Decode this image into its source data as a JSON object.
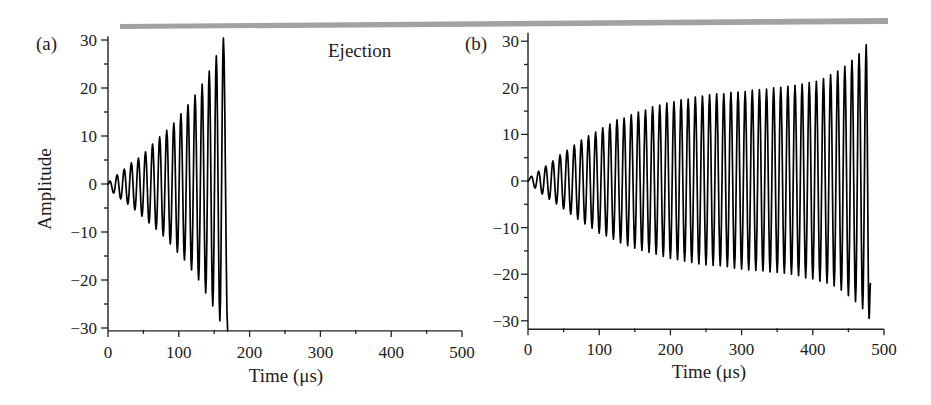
{
  "figure": {
    "header_rule_color": "#a2a2a2",
    "line_color": "#000000"
  },
  "chart_data": [
    {
      "type": "line",
      "panel_label": "(a)",
      "annotation": "Ejection",
      "title": "",
      "xlabel": "Time (μs)",
      "ylabel": "Amplitude",
      "xlim": [
        0,
        500
      ],
      "ylim": [
        -30.6,
        30.8
      ],
      "grid": false,
      "legend": null,
      "xticks": [
        0,
        100,
        200,
        300,
        400,
        500
      ],
      "xtick_labels": [
        "0",
        "100",
        "200",
        "300",
        "400",
        "500"
      ],
      "xticks_minor": [
        50,
        150,
        250,
        350,
        450
      ],
      "yticks": [
        30,
        20,
        10,
        0,
        -10,
        -20,
        -30
      ],
      "ytick_labels": [
        "30",
        "20",
        "10",
        "0",
        "−10",
        "−20",
        "−30"
      ],
      "yticks_minor": [
        25,
        15,
        5,
        -5,
        -15,
        -25
      ],
      "series": [
        {
          "name": "Ion oscillation amplitude (ejected at ~170 μs)",
          "oscillation_period_us": 10,
          "start": [
            0,
            0
          ],
          "peaks": [
            [
              3,
              0.6
            ],
            [
              13,
              1.9
            ],
            [
              23,
              3.1
            ],
            [
              33,
              4.4
            ],
            [
              43,
              5.4
            ],
            [
              53,
              6.7
            ],
            [
              63,
              8.3
            ],
            [
              73,
              9.8
            ],
            [
              83,
              11.2
            ],
            [
              93,
              12.7
            ],
            [
              103,
              14.6
            ],
            [
              113,
              16.5
            ],
            [
              123,
              18.5
            ],
            [
              133,
              20.8
            ],
            [
              143,
              23.5
            ],
            [
              153,
              26.7
            ],
            [
              163,
              30.4
            ]
          ],
          "troughs": [
            [
              8,
              -1.9
            ],
            [
              18,
              -3.1
            ],
            [
              28,
              -4.2
            ],
            [
              38,
              -5.4
            ],
            [
              48,
              -6.7
            ],
            [
              58,
              -8.1
            ],
            [
              68,
              -9.4
            ],
            [
              78,
              -10.8
            ],
            [
              88,
              -12.5
            ],
            [
              98,
              -14.2
            ],
            [
              108,
              -15.8
            ],
            [
              118,
              -17.9
            ],
            [
              128,
              -20.0
            ],
            [
              138,
              -22.7
            ],
            [
              148,
              -25.4
            ],
            [
              158,
              -28.5
            ]
          ],
          "end": [
            169,
            -30.6
          ]
        }
      ]
    },
    {
      "type": "line",
      "panel_label": "(b)",
      "title": "",
      "xlabel": "Time (μs)",
      "ylabel": "",
      "xlim": [
        0,
        500
      ],
      "ylim": [
        -31.8,
        31.8
      ],
      "grid": false,
      "legend": null,
      "xticks": [
        0,
        100,
        200,
        300,
        400,
        500
      ],
      "xtick_labels": [
        "0",
        "100",
        "200",
        "300",
        "400",
        "500"
      ],
      "xticks_minor": [
        50,
        150,
        250,
        350,
        450
      ],
      "yticks": [
        30,
        20,
        10,
        0,
        -10,
        -20,
        -30
      ],
      "ytick_labels": [
        "30",
        "20",
        "10",
        "0",
        "−10",
        "−20",
        "−30"
      ],
      "yticks_minor": [
        25,
        15,
        5,
        -5,
        -15,
        -25
      ],
      "series": [
        {
          "name": "Ion oscillation amplitude (ends at ~480 μs)",
          "oscillation_period_us": 10,
          "start": [
            0,
            0
          ],
          "peaks": [
            [
              5,
              1.0
            ],
            [
              15,
              2.1
            ],
            [
              25,
              3.2
            ],
            [
              35,
              4.3
            ],
            [
              45,
              5.6
            ],
            [
              55,
              6.6
            ],
            [
              65,
              7.7
            ],
            [
              75,
              8.8
            ],
            [
              85,
              9.7
            ],
            [
              95,
              10.5
            ],
            [
              105,
              11.4
            ],
            [
              115,
              12.2
            ],
            [
              125,
              13.1
            ],
            [
              135,
              13.5
            ],
            [
              145,
              14.2
            ],
            [
              155,
              14.8
            ],
            [
              165,
              15.2
            ],
            [
              175,
              15.9
            ],
            [
              185,
              16.3
            ],
            [
              195,
              16.7
            ],
            [
              205,
              17.0
            ],
            [
              215,
              17.4
            ],
            [
              225,
              17.6
            ],
            [
              235,
              18.0
            ],
            [
              245,
              18.2
            ],
            [
              255,
              18.5
            ],
            [
              265,
              18.7
            ],
            [
              275,
              18.7
            ],
            [
              285,
              19.0
            ],
            [
              295,
              19.1
            ],
            [
              305,
              19.2
            ],
            [
              315,
              19.5
            ],
            [
              325,
              19.6
            ],
            [
              335,
              19.7
            ],
            [
              345,
              20.0
            ],
            [
              355,
              20.1
            ],
            [
              365,
              20.3
            ],
            [
              375,
              20.5
            ],
            [
              385,
              20.8
            ],
            [
              395,
              21.1
            ],
            [
              405,
              21.4
            ],
            [
              415,
              22.0
            ],
            [
              425,
              22.8
            ],
            [
              435,
              23.6
            ],
            [
              445,
              24.6
            ],
            [
              455,
              25.9
            ],
            [
              465,
              27.3
            ],
            [
              475,
              29.2
            ]
          ],
          "troughs": [
            [
              10,
              -1.5
            ],
            [
              20,
              -2.8
            ],
            [
              30,
              -3.9
            ],
            [
              40,
              -4.9
            ],
            [
              50,
              -6.0
            ],
            [
              60,
              -7.1
            ],
            [
              70,
              -8.2
            ],
            [
              80,
              -9.2
            ],
            [
              90,
              -10.1
            ],
            [
              100,
              -11.2
            ],
            [
              110,
              -11.8
            ],
            [
              120,
              -12.5
            ],
            [
              130,
              -13.3
            ],
            [
              140,
              -13.9
            ],
            [
              150,
              -14.4
            ],
            [
              160,
              -14.9
            ],
            [
              170,
              -15.3
            ],
            [
              180,
              -15.7
            ],
            [
              190,
              -16.2
            ],
            [
              200,
              -16.6
            ],
            [
              210,
              -16.9
            ],
            [
              220,
              -17.2
            ],
            [
              230,
              -17.5
            ],
            [
              240,
              -17.8
            ],
            [
              250,
              -18.0
            ],
            [
              260,
              -18.1
            ],
            [
              270,
              -18.2
            ],
            [
              280,
              -18.4
            ],
            [
              290,
              -18.7
            ],
            [
              300,
              -18.9
            ],
            [
              310,
              -19.1
            ],
            [
              320,
              -19.2
            ],
            [
              330,
              -19.3
            ],
            [
              340,
              -19.5
            ],
            [
              350,
              -19.6
            ],
            [
              360,
              -19.8
            ],
            [
              370,
              -20.0
            ],
            [
              380,
              -20.3
            ],
            [
              390,
              -20.8
            ],
            [
              400,
              -21.0
            ],
            [
              410,
              -21.5
            ],
            [
              420,
              -21.9
            ],
            [
              430,
              -22.5
            ],
            [
              440,
              -23.4
            ],
            [
              450,
              -24.6
            ],
            [
              460,
              -25.9
            ],
            [
              470,
              -27.4
            ],
            [
              479,
              -29.5
            ]
          ],
          "end": [
            481,
            -22.0
          ]
        }
      ]
    }
  ]
}
